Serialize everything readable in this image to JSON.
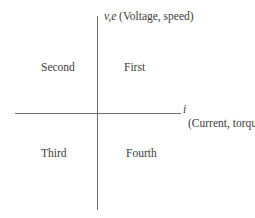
{
  "diagram": {
    "type": "four-quadrant operation diagram",
    "vertical_axis": {
      "symbol": "v,e",
      "description": "(Voltage, speed)"
    },
    "horizontal_axis": {
      "symbol": "i",
      "description": "(Current, torque)"
    },
    "quadrants": {
      "first": "First",
      "second": "Second",
      "third": "Third",
      "fourth": "Fourth"
    },
    "colors": {
      "axis": "#6e6e6e",
      "text": "#3c3c3c",
      "background": "#ffffff"
    }
  }
}
